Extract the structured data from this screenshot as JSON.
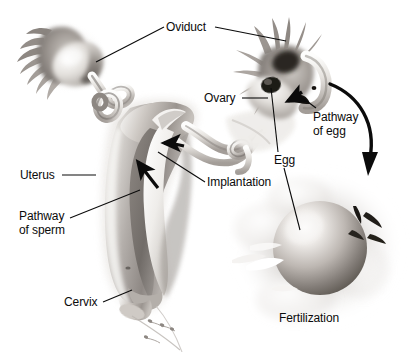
{
  "figure": {
    "caption": "Fertilization",
    "background_color": "#ffffff",
    "line_color": "#0b0b0b",
    "text_color": "#0b0b0b"
  },
  "labels": {
    "oviduct": "Oviduct",
    "ovary": "Ovary",
    "pathway_of_egg_line1": "Pathway",
    "pathway_of_egg_line2": "of egg",
    "egg": "Egg",
    "uterus": "Uterus",
    "implantation": "Implantation",
    "pathway_of_sperm_line1": "Pathway",
    "pathway_of_sperm_line2": "of sperm",
    "cervix": "Cervix",
    "fertilization": "Fertilization"
  },
  "structures": {
    "left_oviduct": "oviduct-left",
    "left_fimbriae": "fimbriae-left",
    "left_ovary": "ovary-left",
    "right_oviduct": "oviduct-right",
    "right_fimbriae": "fimbriae-right",
    "right_ovary": "ovary-right",
    "uterus_body": "uterus-cross-section",
    "uterine_cavity": "uterine-cavity",
    "cervix_canal": "cervix-canal",
    "vagina_sperm": "sperm-cluster-vagina",
    "fertilization_egg": "ovum-sphere",
    "fertilization_corona": "corona-cloud",
    "fertilization_sperm": "sperm-cluster-fertilization"
  },
  "arrows": {
    "sperm_arrow_lower": "arrow-sperm-ascending",
    "sperm_arrow_upper": "arrow-sperm-into-oviduct",
    "egg_arrow_small": "arrow-egg-release",
    "egg_arrow_curved": "arrow-egg-to-fertilization"
  }
}
